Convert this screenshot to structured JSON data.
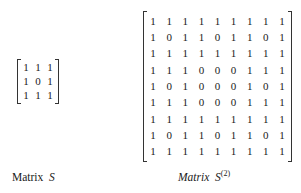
{
  "figure": {
    "matrix_s": {
      "rows": [
        [
          "1",
          "1",
          "1"
        ],
        [
          "1",
          "0",
          "1"
        ],
        [
          "1",
          "1",
          "1"
        ]
      ],
      "label_word": "Matrix",
      "label_symbol": "S"
    },
    "matrix_s2": {
      "rows": [
        [
          "1",
          "1",
          "1",
          "1",
          "1",
          "1",
          "1",
          "1",
          "1"
        ],
        [
          "1",
          "0",
          "1",
          "1",
          "0",
          "1",
          "1",
          "0",
          "1"
        ],
        [
          "1",
          "1",
          "1",
          "1",
          "1",
          "1",
          "1",
          "1",
          "1"
        ],
        [
          "1",
          "1",
          "1",
          "0",
          "0",
          "0",
          "1",
          "1",
          "1"
        ],
        [
          "1",
          "0",
          "1",
          "0",
          "0",
          "0",
          "1",
          "0",
          "1"
        ],
        [
          "1",
          "1",
          "1",
          "0",
          "0",
          "0",
          "1",
          "1",
          "1"
        ],
        [
          "1",
          "1",
          "1",
          "1",
          "1",
          "1",
          "1",
          "1",
          "1"
        ],
        [
          "1",
          "0",
          "1",
          "1",
          "0",
          "1",
          "1",
          "0",
          "1"
        ],
        [
          "1",
          "1",
          "1",
          "1",
          "1",
          "1",
          "1",
          "1",
          "1"
        ]
      ],
      "label_word": "Matrix",
      "label_symbol": "S",
      "label_superscript": "(2)"
    }
  }
}
